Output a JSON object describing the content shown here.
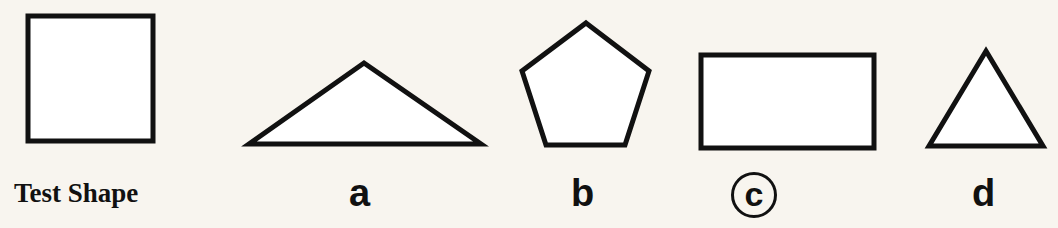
{
  "colors": {
    "background": "#f8f5ef",
    "stroke": "#111111",
    "fill": "#ffffff"
  },
  "test_shape": {
    "label": "Test Shape",
    "shape": "square"
  },
  "options": [
    {
      "label": "a",
      "shape": "obtuse-triangle",
      "selected": false
    },
    {
      "label": "b",
      "shape": "pentagon",
      "selected": false
    },
    {
      "label": "c",
      "shape": "rectangle",
      "selected": true
    },
    {
      "label": "d",
      "shape": "equilateral-triangle",
      "selected": false
    }
  ]
}
